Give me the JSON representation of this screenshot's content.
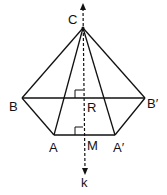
{
  "diagram": {
    "type": "geometry-figure",
    "labels": {
      "C": "C",
      "B": "B",
      "B_prime": "B′",
      "R": "R",
      "A": "A",
      "M": "M",
      "A_prime": "A′",
      "k": "k"
    },
    "points": {
      "C": [
        83,
        28
      ],
      "B": [
        22,
        98
      ],
      "B_prime": [
        145,
        98
      ],
      "A": [
        54,
        135
      ],
      "A_prime": [
        115,
        135
      ],
      "R": [
        83,
        98
      ],
      "M": [
        83,
        135
      ]
    },
    "segments": [
      "CB",
      "CB'",
      "CA",
      "CA'",
      "BB'",
      "BA",
      "B'A'",
      "AA'"
    ],
    "axis": {
      "name": "k",
      "style": "dashed",
      "direction": "both-arrows",
      "right_angles_at": [
        "R",
        "M"
      ]
    },
    "line_color": "#111111"
  }
}
